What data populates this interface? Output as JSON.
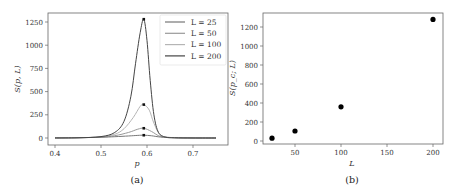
{
  "chart_data": [
    {
      "type": "line",
      "panel": "(a)",
      "title": "",
      "xlabel": "p",
      "ylabel": "S(p, L)",
      "xlim": [
        0.375,
        0.775
      ],
      "ylim": [
        -60,
        1340
      ],
      "xticks": [
        "0.4",
        "0.5",
        "0.6",
        "0.7"
      ],
      "yticks": [
        "0",
        "250",
        "500",
        "750",
        "1000",
        "1250"
      ],
      "grid": false,
      "legend_position": "upper right",
      "series": [
        {
          "name": "L = 25",
          "color": "#777777",
          "peak": {
            "p": 0.593,
            "S": 30
          },
          "x": [
            0.4,
            0.45,
            0.5,
            0.53,
            0.56,
            0.58,
            0.593,
            0.61,
            0.63,
            0.66,
            0.7,
            0.75
          ],
          "y": [
            2,
            4,
            8,
            14,
            22,
            28,
            30,
            24,
            10,
            4,
            1,
            0
          ]
        },
        {
          "name": "L = 50",
          "color": "#999999",
          "peak": {
            "p": 0.593,
            "S": 105
          },
          "x": [
            0.4,
            0.45,
            0.5,
            0.53,
            0.56,
            0.58,
            0.593,
            0.61,
            0.63,
            0.66,
            0.7,
            0.75
          ],
          "y": [
            1,
            3,
            10,
            25,
            60,
            95,
            105,
            70,
            15,
            3,
            1,
            0
          ]
        },
        {
          "name": "L = 100",
          "color": "#b5b5b5",
          "peak": {
            "p": 0.593,
            "S": 360
          },
          "x": [
            0.4,
            0.45,
            0.5,
            0.53,
            0.55,
            0.57,
            0.585,
            0.593,
            0.605,
            0.615,
            0.63,
            0.66,
            0.7,
            0.75
          ],
          "y": [
            0,
            2,
            12,
            40,
            100,
            220,
            340,
            360,
            300,
            160,
            30,
            3,
            0,
            0
          ]
        },
        {
          "name": "L = 200",
          "color": "#444444",
          "peak": {
            "p": 0.593,
            "S": 1280
          },
          "x": [
            0.4,
            0.45,
            0.5,
            0.53,
            0.55,
            0.565,
            0.575,
            0.585,
            0.593,
            0.6,
            0.607,
            0.615,
            0.625,
            0.64,
            0.66,
            0.7,
            0.75
          ],
          "y": [
            0,
            2,
            15,
            60,
            180,
            450,
            800,
            1130,
            1280,
            1050,
            620,
            250,
            60,
            10,
            2,
            0,
            0
          ]
        }
      ]
    },
    {
      "type": "scatter",
      "panel": "(b)",
      "title": "",
      "xlabel": "L",
      "ylabel": "S(p_c; L)",
      "xlim": [
        16,
        209
      ],
      "ylim": [
        -60,
        1370
      ],
      "xticks": [
        "50",
        "100",
        "150",
        "200"
      ],
      "yticks": [
        "0",
        "200",
        "400",
        "600",
        "800",
        "1000",
        "1200"
      ],
      "grid": false,
      "series": [
        {
          "name": "S(p_c; L)",
          "color": "#000000",
          "x": [
            25,
            50,
            100,
            200
          ],
          "y": [
            30,
            105,
            360,
            1280
          ]
        }
      ]
    }
  ],
  "panels": {
    "a": {
      "caption": "(a)",
      "xlabel": "p",
      "ylabel": "S(p, L)",
      "xticks": [
        "0.4",
        "0.5",
        "0.6",
        "0.7"
      ],
      "yticks": [
        "0",
        "250",
        "500",
        "750",
        "1000",
        "1250"
      ],
      "legend": [
        "L = 25",
        "L = 50",
        "L = 100",
        "L = 200"
      ]
    },
    "b": {
      "caption": "(b)",
      "xlabel": "L",
      "ylabel": "S(p_c; L)",
      "xticks": [
        "50",
        "100",
        "150",
        "200"
      ],
      "yticks": [
        "0",
        "200",
        "400",
        "600",
        "800",
        "1000",
        "1200"
      ]
    }
  }
}
